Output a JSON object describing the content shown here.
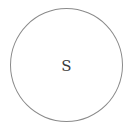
{
  "diagram": {
    "type": "state-node",
    "nodes": [
      {
        "label": "S",
        "shape": "circle",
        "stroke_color": "#8a8a8a",
        "text_color": "#3a3a3a"
      }
    ]
  }
}
